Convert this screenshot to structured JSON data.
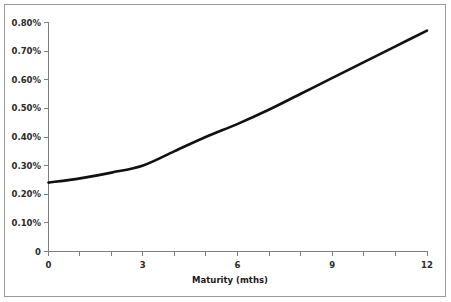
{
  "chart_data": {
    "type": "line",
    "title": "",
    "subtitle": "",
    "xlabel": "Maturity (mths)",
    "ylabel": "",
    "xlim": [
      0,
      12
    ],
    "ylim": [
      0,
      0.008
    ],
    "grid": false,
    "legend": null,
    "x": [
      0,
      1,
      2,
      3,
      4,
      5,
      6,
      7,
      8,
      9,
      10,
      11,
      12
    ],
    "values": [
      0.0024,
      0.00255,
      0.00275,
      0.003,
      0.0035,
      0.004,
      0.00445,
      0.00495,
      0.0055,
      0.00605,
      0.0066,
      0.00715,
      0.0077
    ],
    "series": [
      {
        "name": "Yield",
        "color": "#111111",
        "values": [
          0.0024,
          0.00255,
          0.00275,
          0.003,
          0.0035,
          0.004,
          0.00445,
          0.00495,
          0.0055,
          0.00605,
          0.0066,
          0.00715,
          0.0077
        ]
      }
    ],
    "y_ticks": [
      0,
      0.001,
      0.002,
      0.003,
      0.004,
      0.005,
      0.006,
      0.007,
      0.008
    ],
    "y_tick_labels": [
      "0",
      "0.10%",
      "0.20%",
      "0.30%",
      "0.40%",
      "0.50%",
      "0.60%",
      "0.70%",
      "0.80%"
    ],
    "x_ticks_major": [
      0,
      3,
      6,
      9,
      12
    ],
    "x_tick_labels": [
      "0",
      "3",
      "6",
      "9",
      "12"
    ],
    "x_ticks_minor": [
      1,
      2,
      4,
      5,
      7,
      8,
      10,
      11
    ]
  },
  "axis": {
    "y_labels": {
      "t8": "0.80%",
      "t7": "0.70%",
      "t6": "0.60%",
      "t5": "0.50%",
      "t4": "0.40%",
      "t3": "0.30%",
      "t2": "0.20%",
      "t1": "0.10%",
      "t0": "0"
    },
    "x_labels": {
      "t0": "0",
      "t3": "3",
      "t6": "6",
      "t9": "9",
      "t12": "12"
    },
    "x_title": "Maturity (mths)"
  }
}
